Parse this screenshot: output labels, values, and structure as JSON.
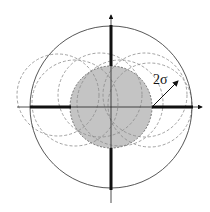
{
  "diagram": {
    "label": "2σ",
    "center": [
      111,
      107
    ],
    "outer_circle_radius": 81,
    "inner_circle_radius": 41,
    "inner_fill": "#c4c4c4",
    "dashed_circles": [
      {
        "cx": 58,
        "cy": 95,
        "r": 41
      },
      {
        "cx": 75,
        "cy": 103,
        "r": 43
      },
      {
        "cx": 100,
        "cy": 95,
        "r": 42
      },
      {
        "cx": 120,
        "cy": 103,
        "r": 43
      },
      {
        "cx": 145,
        "cy": 95,
        "r": 42
      },
      {
        "cx": 150,
        "cy": 105,
        "r": 42
      }
    ]
  }
}
